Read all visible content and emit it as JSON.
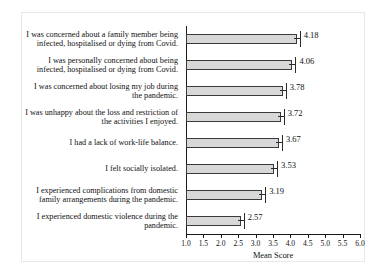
{
  "chart_data": {
    "type": "bar",
    "orientation": "horizontal",
    "title": "",
    "xlabel": "Mean Score",
    "ylabel": "",
    "xlim": [
      1.0,
      6.0
    ],
    "grid": false,
    "legend": null,
    "error_bars": true,
    "tick_labels": [
      "1.0",
      "1.5",
      "2.0",
      "2.5",
      "3.0",
      "3.5",
      "4.0",
      "4.5",
      "5.0",
      "5.5",
      "6.0"
    ],
    "tick_values": [
      1.0,
      1.5,
      2.0,
      2.5,
      3.0,
      3.5,
      4.0,
      4.5,
      5.0,
      5.5,
      6.0
    ],
    "categories": [
      "I was concerned about a family member being infected, hospitalised or dying from Covid.",
      "I was personally concerned about being infected, hospitalised or dying from Covid.",
      "I was concerned about losing my job during the pandemic.",
      "I was unhappy about the loss and restriction of the activities I enjoyed.",
      "I had a lack of work-life balance.",
      "I felt socially isolated.",
      "I experienced complications from domestic family arrangements during the pandemic.",
      "I experienced domestic violence during the pandemic."
    ],
    "values": [
      4.18,
      4.06,
      3.78,
      3.72,
      3.67,
      3.53,
      3.19,
      2.57
    ],
    "value_labels": [
      "4.18",
      "4.06",
      "3.78",
      "3.72",
      "3.67",
      "3.53",
      "3.19",
      "2.57"
    ],
    "colors": {
      "bar_fill": "#d8d8d8",
      "bar_border": "#3a3a3a",
      "axis": "#1a1a1a",
      "text": "#111111",
      "background": "#ffffff"
    }
  }
}
